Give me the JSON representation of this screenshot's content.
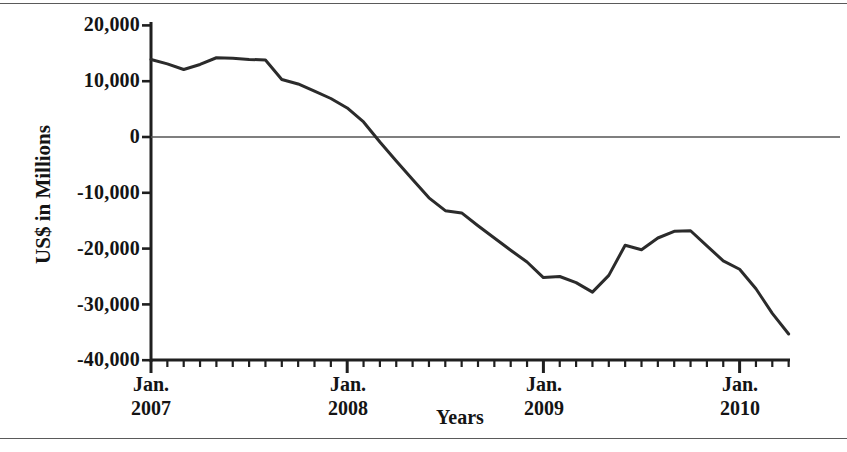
{
  "chart_data": {
    "type": "line",
    "title": "",
    "xlabel": "Years",
    "ylabel": "US$ in Millions",
    "ylim": [
      -40000,
      20000
    ],
    "yticks": [
      20000,
      10000,
      0,
      -10000,
      -20000,
      -30000,
      -40000
    ],
    "ytick_labels": [
      "20,000",
      "10,000",
      "0",
      "-10,000",
      "-20,000",
      "-30,000",
      "-40,000"
    ],
    "xtick_labels": [
      {
        "line1": "Jan.",
        "line2": "2007"
      },
      {
        "line1": "Jan.",
        "line2": "2008"
      },
      {
        "line1": "Jan.",
        "line2": "2009"
      },
      {
        "line1": "Jan.",
        "line2": "2010"
      }
    ],
    "x_major_values": [
      "2007-01",
      "2008-01",
      "2009-01",
      "2010-01"
    ],
    "x_minor_interval": "month",
    "xlim": [
      "2007-01",
      "2010-04"
    ],
    "grid": false,
    "zero_line": true,
    "legend": null,
    "line_color": "#2b2b2b",
    "line_width": 3,
    "x": [
      "2007-01",
      "2007-02",
      "2007-03",
      "2007-04",
      "2007-05",
      "2007-06",
      "2007-07",
      "2007-08",
      "2007-09",
      "2007-10",
      "2007-11",
      "2007-12",
      "2008-01",
      "2008-02",
      "2008-03",
      "2008-04",
      "2008-05",
      "2008-06",
      "2008-07",
      "2008-08",
      "2008-09",
      "2008-10",
      "2008-11",
      "2008-12",
      "2009-01",
      "2009-02",
      "2009-03",
      "2009-04",
      "2009-05",
      "2009-06",
      "2009-07",
      "2009-08",
      "2009-09",
      "2009-10",
      "2009-11",
      "2009-12",
      "2010-01",
      "2010-02",
      "2010-03",
      "2010-04"
    ],
    "values": [
      13900,
      13100,
      12100,
      13000,
      14200,
      14100,
      13900,
      13800,
      10300,
      9500,
      8200,
      6900,
      5200,
      2700,
      -900,
      -4300,
      -7600,
      -10900,
      -13200,
      -13600,
      -15900,
      -18100,
      -20300,
      -22400,
      -25200,
      -25000,
      -26100,
      -27800,
      -24800,
      -19400,
      -20200,
      -18100,
      -16900,
      -16800,
      -19500,
      -22200,
      -23700,
      -27200,
      -31600,
      -35300
    ],
    "series_name": "US$ in Millions"
  },
  "axis": {
    "y_title": "US$ in Millions",
    "x_title": "Years"
  }
}
